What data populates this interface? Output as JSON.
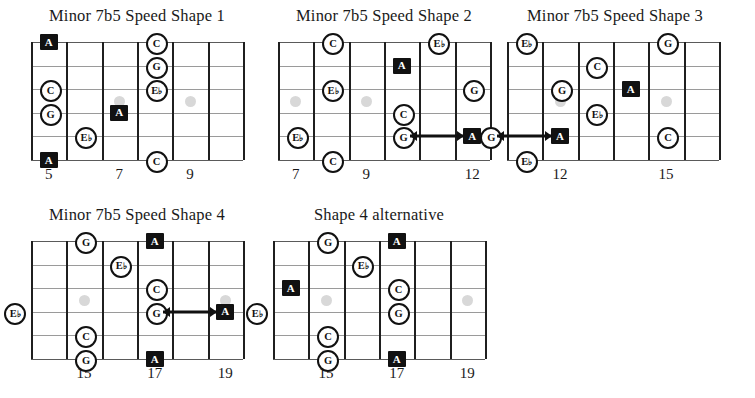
{
  "page": {
    "width": 755,
    "height": 398,
    "background": "#ffffff",
    "ink": "#111111",
    "string_color": "#9a9a9a",
    "inlay_color": "#d8d8d8",
    "root_marker_fill": "#111111",
    "root_marker_text": "#ffffff",
    "open_marker_fill": "#ffffff",
    "open_marker_text": "#111111"
  },
  "legend": {
    "root_symbol": "A",
    "note_symbols": [
      "C",
      "G",
      "E♭"
    ],
    "marker_types": [
      "root-black-square",
      "note-open-circle"
    ],
    "inlay_symbol": "fret-inlay-dot",
    "arrow_symbol": "position-shift-arrow"
  },
  "chart_data": {
    "type": "table",
    "strings": 6,
    "fret_spaces_per_diagram": 6,
    "diagrams": [
      {
        "id": "shape-1",
        "title": "Minor 7b5 Speed Shape 1",
        "x": 28,
        "y": 6,
        "w": 218,
        "h": 185,
        "board": {
          "left": 3,
          "top": 36,
          "width": 212,
          "height": 118
        },
        "fret_labels": [
          {
            "label": "5",
            "fret_index": 1
          },
          {
            "label": "7",
            "fret_index": 3
          },
          {
            "label": "9",
            "fret_index": 5
          }
        ],
        "inlays": [
          {
            "fret_index": 3
          },
          {
            "fret_index": 5
          }
        ],
        "markers": [
          {
            "note": "A",
            "type": "root",
            "string": 1,
            "fret_index": 1
          },
          {
            "note": "C",
            "type": "open",
            "string": 3,
            "fret_index": 1
          },
          {
            "note": "G",
            "type": "open",
            "string": 4,
            "fret_index": 1
          },
          {
            "note": "A",
            "type": "root",
            "string": 6,
            "fret_index": 1
          },
          {
            "note": "E♭",
            "type": "open",
            "string": 5,
            "fret_index": 2
          },
          {
            "note": "A",
            "type": "root",
            "string": 4,
            "fret_index": 3
          },
          {
            "note": "C",
            "type": "open",
            "string": 1,
            "fret_index": 4
          },
          {
            "note": "G",
            "type": "open",
            "string": 2,
            "fret_index": 4
          },
          {
            "note": "E♭",
            "type": "open",
            "string": 3,
            "fret_index": 4
          },
          {
            "note": "C",
            "type": "open",
            "string": 6,
            "fret_index": 4
          }
        ],
        "arrows": []
      },
      {
        "id": "shape-2",
        "title": "Minor 7b5 Speed Shape 2",
        "x": 275,
        "y": 6,
        "w": 218,
        "h": 185,
        "board": {
          "left": 3,
          "top": 36,
          "width": 212,
          "height": 118
        },
        "fret_labels": [
          {
            "label": "7",
            "fret_index": 1
          },
          {
            "label": "9",
            "fret_index": 3
          },
          {
            "label": "12",
            "fret_index": 6
          }
        ],
        "inlays": [
          {
            "fret_index": 1
          },
          {
            "fret_index": 3
          }
        ],
        "markers": [
          {
            "note": "E♭",
            "type": "open",
            "string": 5,
            "fret_index": 1
          },
          {
            "note": "C",
            "type": "open",
            "string": 1,
            "fret_index": 2
          },
          {
            "note": "E♭",
            "type": "open",
            "string": 3,
            "fret_index": 2
          },
          {
            "note": "C",
            "type": "open",
            "string": 6,
            "fret_index": 2
          },
          {
            "note": "A",
            "type": "root",
            "string": 2,
            "fret_index": 4
          },
          {
            "note": "C",
            "type": "open",
            "string": 4,
            "fret_index": 4
          },
          {
            "note": "G",
            "type": "open",
            "string": 5,
            "fret_index": 4
          },
          {
            "note": "E♭",
            "type": "open",
            "string": 1,
            "fret_index": 5
          },
          {
            "note": "G",
            "type": "open",
            "string": 3,
            "fret_index": 6
          },
          {
            "note": "A",
            "type": "root",
            "string": 5,
            "fret_index": 6
          }
        ],
        "arrows": [
          {
            "string": 5,
            "from_fret_index": 4,
            "to_fret_index": 6
          }
        ]
      },
      {
        "id": "shape-3",
        "title": "Minor 7b5 Speed Shape 3",
        "x": 504,
        "y": 6,
        "w": 222,
        "h": 185,
        "board": {
          "left": 3,
          "top": 36,
          "width": 212,
          "height": 118
        },
        "fret_labels": [
          {
            "label": "12",
            "fret_index": 2
          },
          {
            "label": "15",
            "fret_index": 5
          }
        ],
        "inlays": [
          {
            "fret_index": 2
          },
          {
            "fret_index": 5
          }
        ],
        "markers": [
          {
            "note": "E♭",
            "type": "open",
            "string": 1,
            "fret_index": 1
          },
          {
            "note": "G",
            "type": "open",
            "string": 5,
            "fret_index": 0
          },
          {
            "note": "E♭",
            "type": "open",
            "string": 6,
            "fret_index": 1
          },
          {
            "note": "G",
            "type": "open",
            "string": 3,
            "fret_index": 2
          },
          {
            "note": "A",
            "type": "root",
            "string": 5,
            "fret_index": 2
          },
          {
            "note": "C",
            "type": "open",
            "string": 2,
            "fret_index": 3
          },
          {
            "note": "E♭",
            "type": "open",
            "string": 4,
            "fret_index": 3
          },
          {
            "note": "A",
            "type": "root",
            "string": 3,
            "fret_index": 4
          },
          {
            "note": "G",
            "type": "open",
            "string": 1,
            "fret_index": 5
          },
          {
            "note": "C",
            "type": "open",
            "string": 5,
            "fret_index": 5
          }
        ],
        "arrows": [
          {
            "string": 5,
            "from_fret_index": 0,
            "to_fret_index": 2
          }
        ]
      },
      {
        "id": "shape-4",
        "title": "Minor 7b5 Speed Shape 4",
        "x": 28,
        "y": 205,
        "w": 218,
        "h": 185,
        "board": {
          "left": 3,
          "top": 36,
          "width": 212,
          "height": 118
        },
        "fret_labels": [
          {
            "label": "15",
            "fret_index": 2
          },
          {
            "label": "17",
            "fret_index": 4
          },
          {
            "label": "19",
            "fret_index": 6
          }
        ],
        "inlays": [
          {
            "fret_index": 2
          },
          {
            "fret_index": 6
          }
        ],
        "markers": [
          {
            "note": "E♭",
            "type": "open",
            "string": 4,
            "fret_index": 0
          },
          {
            "note": "G",
            "type": "open",
            "string": 1,
            "fret_index": 2
          },
          {
            "note": "C",
            "type": "open",
            "string": 5,
            "fret_index": 2
          },
          {
            "note": "G",
            "type": "open",
            "string": 6,
            "fret_index": 2
          },
          {
            "note": "E♭",
            "type": "open",
            "string": 2,
            "fret_index": 3
          },
          {
            "note": "A",
            "type": "root",
            "string": 1,
            "fret_index": 4
          },
          {
            "note": "C",
            "type": "open",
            "string": 3,
            "fret_index": 4
          },
          {
            "note": "G",
            "type": "open",
            "string": 4,
            "fret_index": 4
          },
          {
            "note": "A",
            "type": "root",
            "string": 6,
            "fret_index": 4
          },
          {
            "note": "A",
            "type": "root",
            "string": 4,
            "fret_index": 6
          }
        ],
        "arrows": [
          {
            "string": 4,
            "from_fret_index": 4,
            "to_fret_index": 6
          }
        ]
      },
      {
        "id": "shape-4-alt",
        "title": "Shape 4 alternative",
        "x": 270,
        "y": 205,
        "w": 218,
        "h": 185,
        "board": {
          "left": 3,
          "top": 36,
          "width": 212,
          "height": 118
        },
        "fret_labels": [
          {
            "label": "15",
            "fret_index": 2
          },
          {
            "label": "17",
            "fret_index": 4
          },
          {
            "label": "19",
            "fret_index": 6
          }
        ],
        "inlays": [
          {
            "fret_index": 2
          },
          {
            "fret_index": 6
          }
        ],
        "markers": [
          {
            "note": "E♭",
            "type": "open",
            "string": 4,
            "fret_index": 0
          },
          {
            "note": "A",
            "type": "root",
            "string": 3,
            "fret_index": 1
          },
          {
            "note": "G",
            "type": "open",
            "string": 1,
            "fret_index": 2
          },
          {
            "note": "C",
            "type": "open",
            "string": 5,
            "fret_index": 2
          },
          {
            "note": "G",
            "type": "open",
            "string": 6,
            "fret_index": 2
          },
          {
            "note": "E♭",
            "type": "open",
            "string": 2,
            "fret_index": 3
          },
          {
            "note": "A",
            "type": "root",
            "string": 1,
            "fret_index": 4
          },
          {
            "note": "C",
            "type": "open",
            "string": 3,
            "fret_index": 4
          },
          {
            "note": "G",
            "type": "open",
            "string": 4,
            "fret_index": 4
          },
          {
            "note": "A",
            "type": "root",
            "string": 6,
            "fret_index": 4
          }
        ],
        "arrows": []
      }
    ]
  }
}
